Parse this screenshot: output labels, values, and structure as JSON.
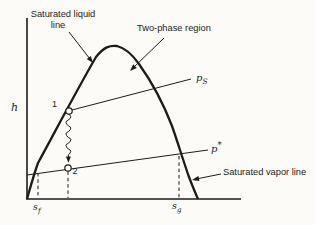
{
  "figure": {
    "title_hint": "enthalpy-entropy saturation dome diagram",
    "colors": {
      "ink": "#1c1c1c",
      "paper": "#fcfbf8"
    },
    "annotations": {
      "saturated_liquid": {
        "line1": "Saturated liquid",
        "line2": "line"
      },
      "two_phase": {
        "label": "Two-phase region"
      },
      "saturated_vapor": {
        "label": "Saturated vapor line"
      }
    },
    "axes": {
      "y_label": "h"
    },
    "isobars": {
      "ps": {
        "base": "p",
        "sub": "S"
      },
      "pstar": {
        "base": "p",
        "sup": "*"
      }
    },
    "points": {
      "p1": "1",
      "p2": "2"
    },
    "x_ticks": {
      "sf": {
        "base": "s",
        "sub": "f"
      },
      "sg": {
        "base": "s",
        "sub": "g"
      }
    }
  }
}
